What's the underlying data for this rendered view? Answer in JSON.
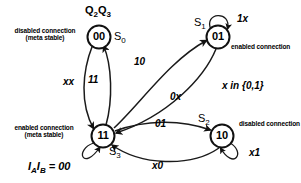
{
  "diagram": {
    "title_label": "Q",
    "header": {
      "q_label_main": "Q",
      "q_sub_2": "2",
      "q_label_second": "Q",
      "q_sub_3": "3"
    },
    "states": [
      {
        "id": "S0",
        "code": "00",
        "name_main": "S",
        "name_sub": "0",
        "annotation_line1": "disabled connection",
        "annotation_line2": "(meta stable)",
        "cx": 99,
        "cy": 37
      },
      {
        "id": "S1",
        "code": "01",
        "name_main": "S",
        "name_sub": "1",
        "annotation_line1": "enabled connection",
        "annotation_line2": "",
        "cx": 218,
        "cy": 37,
        "self_loop_label": "1x"
      },
      {
        "id": "S2",
        "code": "10",
        "name_main": "S",
        "name_sub": "2",
        "annotation_line1": "disabled connection",
        "annotation_line2": "",
        "cx": 222,
        "cy": 136,
        "self_loop_label": "x1"
      },
      {
        "id": "S3",
        "code": "11",
        "name_main": "S",
        "name_sub": "3",
        "annotation_line1": "enabled connection",
        "annotation_line2": "(meta stable)",
        "cx": 103,
        "cy": 136,
        "self_loop_label": ""
      }
    ],
    "transitions": [
      {
        "from": "S0",
        "to": "S3",
        "label": "xx"
      },
      {
        "from": "S3",
        "to": "S0",
        "label": "11"
      },
      {
        "from": "S3",
        "to": "S1",
        "label": "10"
      },
      {
        "from": "S1",
        "to": "S3",
        "label": "0x"
      },
      {
        "from": "S3",
        "to": "S2",
        "label": "01"
      },
      {
        "from": "S2",
        "to": "S3",
        "label": "x0"
      },
      {
        "from": "S1",
        "to": "S1",
        "label": "1x"
      },
      {
        "from": "S2",
        "to": "S2",
        "label": "x1"
      }
    ],
    "legend": {
      "x_domain": "x in {0,1}",
      "input_main_a": "I",
      "input_sub_a": "A",
      "input_main_b": "I",
      "input_sub_b": "B",
      "input_value": " = 00"
    },
    "colors": {
      "stroke": "#111111",
      "background": "#ffffff",
      "text": "#000000"
    }
  }
}
